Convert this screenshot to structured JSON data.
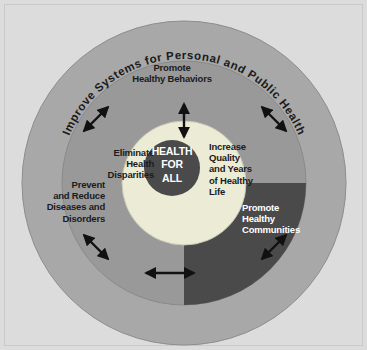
{
  "figure": {
    "background_color": "#dcdcdc"
  },
  "rings": {
    "outer": {
      "name": "outer-ring",
      "color": "#a8a8a8",
      "label": "Improve Systems for Personal and Public Health"
    },
    "middle": {
      "name": "middle-ring",
      "light_color": "#999999",
      "dark_color": "#4a4a4a",
      "labels": [
        {
          "id": "promote-healthy-behaviors",
          "text": "Promote\nHealthy Behaviors",
          "position": "top",
          "color": "#1b1b1b"
        },
        {
          "id": "prevent-and-reduce",
          "text": "Prevent\nand Reduce\nDiseases and\nDisorders",
          "position": "left",
          "color": "#1b1b1b"
        },
        {
          "id": "promote-healthy-communities",
          "text": "Promote\nHealthy\nCommunities",
          "position": "right",
          "color": "#ffffff"
        }
      ]
    },
    "inner": {
      "name": "inner-ring",
      "color": "#ececd6",
      "labels": [
        {
          "id": "eliminate-health-disparities",
          "text": "Eliminate\nHealth\nDisparities",
          "position": "left"
        },
        {
          "id": "increase-quality-years",
          "text": "Increase\nQuality\nand Years\nof Healthy\nLife",
          "position": "right"
        }
      ]
    },
    "core": {
      "name": "core-circle",
      "color": "#4a4a4a",
      "text": "HEALTH\nFOR\nALL",
      "text_color": "#ffffff"
    }
  },
  "arrows": {
    "color": "#111111",
    "items": [
      {
        "id": "arrow-top",
        "direction": "vertical",
        "angle_deg": 90
      },
      {
        "id": "arrow-upper-left",
        "direction": "diagonal",
        "angle_deg": 135
      },
      {
        "id": "arrow-upper-right",
        "direction": "diagonal",
        "angle_deg": 45
      },
      {
        "id": "arrow-lower-left",
        "direction": "diagonal",
        "angle_deg": 225
      },
      {
        "id": "arrow-lower-right",
        "direction": "diagonal",
        "angle_deg": 315
      },
      {
        "id": "arrow-bottom",
        "direction": "horizontal",
        "angle_deg": 270
      }
    ]
  }
}
